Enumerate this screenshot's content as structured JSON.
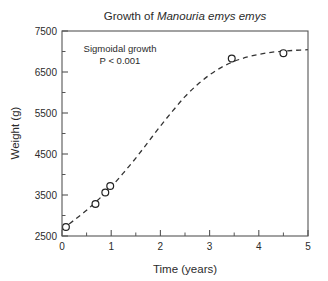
{
  "chart_data": {
    "type": "scatter",
    "title_prefix": "Growth of ",
    "title_species": "Manouria emys emys",
    "title": "Growth of Manouria emys emys",
    "xlabel": "Time (years)",
    "ylabel": "Weight (g)",
    "xlim": [
      0,
      5
    ],
    "ylim": [
      2500,
      7500
    ],
    "xticks": [
      "0",
      "1",
      "2",
      "3",
      "4",
      "5"
    ],
    "xtick_values": [
      0,
      1,
      2,
      3,
      4,
      5
    ],
    "xminor_values": [
      0.5,
      1.5,
      2.5,
      3.5,
      4.5
    ],
    "yticks": [
      "2500",
      "3500",
      "4500",
      "5500",
      "6500",
      "7500"
    ],
    "ytick_values": [
      2500,
      3500,
      4500,
      5500,
      6500,
      7500
    ],
    "yminor_values": [
      3000,
      4000,
      5000,
      6000,
      7000
    ],
    "grid": false,
    "legend": null,
    "marker": "open-circle",
    "fit_line_style": "dashed",
    "x": [
      0.08,
      0.68,
      0.88,
      0.98,
      3.45,
      4.5
    ],
    "y": [
      2720,
      3280,
      3560,
      3720,
      6830,
      6960
    ],
    "points": [
      {
        "x": 0.08,
        "y": 2720
      },
      {
        "x": 0.68,
        "y": 3280
      },
      {
        "x": 0.88,
        "y": 3560
      },
      {
        "x": 0.98,
        "y": 3720
      },
      {
        "x": 3.45,
        "y": 6830
      },
      {
        "x": 4.5,
        "y": 6960
      }
    ],
    "fit_curve": [
      {
        "x": 0.0,
        "y": 2660
      },
      {
        "x": 0.25,
        "y": 2890
      },
      {
        "x": 0.5,
        "y": 3130
      },
      {
        "x": 0.75,
        "y": 3400
      },
      {
        "x": 1.0,
        "y": 3700
      },
      {
        "x": 1.25,
        "y": 4040
      },
      {
        "x": 1.5,
        "y": 4400
      },
      {
        "x": 1.75,
        "y": 4790
      },
      {
        "x": 2.0,
        "y": 5180
      },
      {
        "x": 2.25,
        "y": 5550
      },
      {
        "x": 2.5,
        "y": 5900
      },
      {
        "x": 2.75,
        "y": 6190
      },
      {
        "x": 3.0,
        "y": 6430
      },
      {
        "x": 3.25,
        "y": 6620
      },
      {
        "x": 3.5,
        "y": 6760
      },
      {
        "x": 3.75,
        "y": 6860
      },
      {
        "x": 4.0,
        "y": 6930
      },
      {
        "x": 4.25,
        "y": 6980
      },
      {
        "x": 4.5,
        "y": 7010
      },
      {
        "x": 4.75,
        "y": 7030
      },
      {
        "x": 5.0,
        "y": 7045
      }
    ],
    "annotations": [
      {
        "text": "Sigmoidal growth"
      },
      {
        "text": "P < 0.001"
      }
    ],
    "annotation_line1": "Sigmoidal growth",
    "annotation_line2": "P < 0.001",
    "colors": {
      "background": "#ffffff",
      "axis": "#555555",
      "text": "#2b2b2b",
      "curve": "#333333",
      "marker_stroke": "#222222",
      "marker_fill": "#ffffff"
    }
  }
}
